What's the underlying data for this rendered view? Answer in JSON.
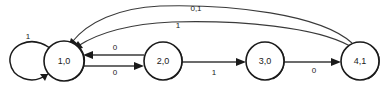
{
  "diagram": {
    "type": "state-transition-diagram",
    "states": [
      {
        "id": "s1",
        "label": "1,0",
        "cx": 64,
        "cy": 61,
        "r": 20
      },
      {
        "id": "s2",
        "label": "2,0",
        "cx": 163,
        "cy": 61,
        "r": 19
      },
      {
        "id": "s3",
        "label": "3,0",
        "cx": 265,
        "cy": 61,
        "r": 19
      },
      {
        "id": "s4",
        "label": "4,1",
        "cx": 360,
        "cy": 61,
        "r": 19
      }
    ],
    "transitions": [
      {
        "id": "t_self",
        "from": "s1",
        "to": "s1",
        "label": "1",
        "lx": 28,
        "ly": 37
      },
      {
        "id": "t_12",
        "from": "s1",
        "to": "s2",
        "label": "0",
        "lx": 115,
        "ly": 73
      },
      {
        "id": "t_21",
        "from": "s2",
        "to": "s1",
        "label": "0",
        "lx": 115,
        "ly": 48
      },
      {
        "id": "t_23",
        "from": "s2",
        "to": "s3",
        "label": "1",
        "lx": 214,
        "ly": 73
      },
      {
        "id": "t_34",
        "from": "s3",
        "to": "s4",
        "label": "0",
        "lx": 314,
        "ly": 71
      },
      {
        "id": "t_41_a",
        "from": "s4",
        "to": "s1",
        "label": "0,1",
        "lx": 196,
        "ly": 9
      },
      {
        "id": "t_41_b",
        "from": "s4",
        "to": "s1",
        "label": "1",
        "lx": 178,
        "ly": 26
      }
    ],
    "colors": {
      "background": "#ffffff",
      "node_stroke": "#1a1a1a",
      "edge_stroke": "#3a3a3a",
      "text": "#1a1a1a"
    }
  }
}
